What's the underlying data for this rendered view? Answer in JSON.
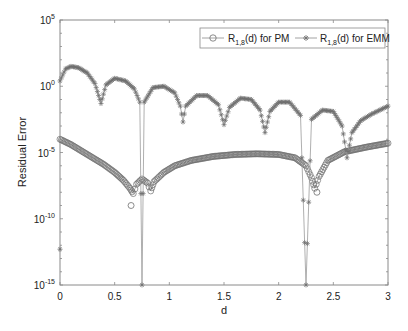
{
  "chart_data": {
    "type": "line",
    "title": "",
    "xlabel": "d",
    "ylabel": "Residual Error",
    "xlim": [
      0,
      3
    ],
    "ylim_log10": [
      -15,
      5
    ],
    "yscale": "log",
    "grid": false,
    "legend_position": "top-right",
    "x_ticks": [
      "0",
      "0.5",
      "1",
      "1.5",
      "2",
      "2.5",
      "3"
    ],
    "x_tick_values": [
      0,
      0.5,
      1,
      1.5,
      2,
      2.5,
      3
    ],
    "y_ticks": [
      {
        "base": "10",
        "exp": "5",
        "value": 5
      },
      {
        "base": "10",
        "exp": "0",
        "value": 0
      },
      {
        "base": "10",
        "exp": "-5",
        "value": -5
      },
      {
        "base": "10",
        "exp": "-10",
        "value": -10
      },
      {
        "base": "10",
        "exp": "-15",
        "value": -15
      }
    ],
    "series": [
      {
        "name": "R_{1,8}(d) for PM",
        "legend_main": "R",
        "legend_sub": "1,8",
        "legend_rest": "(d) for PM",
        "marker": "circle",
        "color": "#6e6e6e",
        "points_log10": [
          [
            0.0,
            -4.0
          ],
          [
            0.1,
            -4.4
          ],
          [
            0.2,
            -4.9
          ],
          [
            0.3,
            -5.4
          ],
          [
            0.4,
            -5.9
          ],
          [
            0.5,
            -6.5
          ],
          [
            0.58,
            -7.1
          ],
          [
            0.64,
            -7.7
          ],
          [
            0.67,
            -8.1
          ],
          [
            0.7,
            -7.4
          ],
          [
            0.75,
            -7.0
          ],
          [
            0.8,
            -7.3
          ],
          [
            0.83,
            -7.9
          ],
          [
            0.86,
            -7.2
          ],
          [
            0.95,
            -6.5
          ],
          [
            1.05,
            -6.0
          ],
          [
            1.2,
            -5.6
          ],
          [
            1.4,
            -5.3
          ],
          [
            1.6,
            -5.15
          ],
          [
            1.8,
            -5.1
          ],
          [
            2.0,
            -5.15
          ],
          [
            2.15,
            -5.4
          ],
          [
            2.25,
            -6.0
          ],
          [
            2.3,
            -6.9
          ],
          [
            2.33,
            -7.7
          ],
          [
            2.37,
            -6.8
          ],
          [
            2.45,
            -5.6
          ],
          [
            2.6,
            -4.95
          ],
          [
            2.8,
            -4.6
          ],
          [
            3.0,
            -4.3
          ]
        ],
        "outlier_points_log10": [
          [
            0.65,
            -9.0
          ],
          [
            2.35,
            -8.0
          ]
        ]
      },
      {
        "name": "R_{1,8}(d) for EMM",
        "legend_main": "R",
        "legend_sub": "1,8",
        "legend_rest": "(d) for EMM",
        "marker": "asterisk",
        "color": "#6e6e6e",
        "points_log10": [
          [
            0.0,
            0.4
          ],
          [
            0.05,
            1.3
          ],
          [
            0.1,
            1.5
          ],
          [
            0.17,
            1.4
          ],
          [
            0.25,
            1.0
          ],
          [
            0.32,
            0.2
          ],
          [
            0.375,
            -1.3
          ],
          [
            0.42,
            0.1
          ],
          [
            0.5,
            0.6
          ],
          [
            0.6,
            0.4
          ],
          [
            0.68,
            -0.2
          ],
          [
            0.73,
            -1.2
          ],
          [
            0.75,
            -15.0
          ],
          [
            0.77,
            -1.2
          ],
          [
            0.85,
            -0.1
          ],
          [
            0.95,
            0.0
          ],
          [
            1.05,
            -0.5
          ],
          [
            1.1,
            -1.5
          ],
          [
            1.125,
            -2.7
          ],
          [
            1.15,
            -1.5
          ],
          [
            1.25,
            -0.7
          ],
          [
            1.35,
            -0.7
          ],
          [
            1.45,
            -1.4
          ],
          [
            1.5,
            -2.9
          ],
          [
            1.55,
            -1.6
          ],
          [
            1.65,
            -0.9
          ],
          [
            1.75,
            -1.0
          ],
          [
            1.83,
            -1.8
          ],
          [
            1.875,
            -3.5
          ],
          [
            1.92,
            -1.9
          ],
          [
            2.0,
            -1.2
          ],
          [
            2.1,
            -1.2
          ],
          [
            2.2,
            -2.2
          ],
          [
            2.25,
            -15.0
          ],
          [
            2.3,
            -2.5
          ],
          [
            2.4,
            -1.8
          ],
          [
            2.5,
            -1.9
          ],
          [
            2.58,
            -3.0
          ],
          [
            2.625,
            -5.4
          ],
          [
            2.67,
            -3.5
          ],
          [
            2.75,
            -2.6
          ],
          [
            2.85,
            -2.1
          ],
          [
            3.0,
            -1.5
          ]
        ],
        "outlier_points_log10": [
          [
            0.0,
            -12.3
          ]
        ]
      }
    ]
  }
}
